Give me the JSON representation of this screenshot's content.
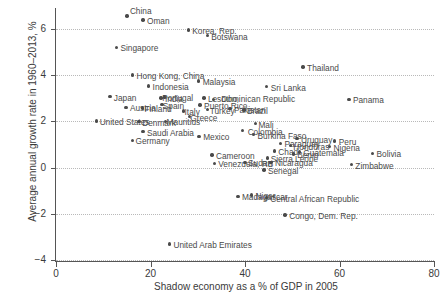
{
  "chart_data": {
    "type": "scatter",
    "title": "",
    "xlabel": "Shadow economy as a % of GDP in 2005",
    "ylabel": "Average annual growth rate in 1960–2013, %",
    "xlim": [
      0,
      80
    ],
    "ylim": [
      -4,
      6.9
    ],
    "xticks": [
      0,
      20,
      40,
      60,
      80
    ],
    "yticks": [
      -4,
      -2,
      0,
      2,
      4,
      6
    ],
    "xtick_labels": [
      "0",
      "20",
      "40",
      "60",
      "80"
    ],
    "ytick_labels": [
      "−4",
      "−2",
      "0",
      "2",
      "4",
      "6"
    ],
    "grid": "dotted-horizontal",
    "legend": "none",
    "marker": "filled-circle",
    "marker_color": "#4a4a4a",
    "points": [
      {
        "label": "China",
        "x": 15.0,
        "y": 6.55,
        "lx": 3,
        "ly": -9
      },
      {
        "label": "Oman",
        "x": 18.4,
        "y": 6.38,
        "lx": 4,
        "ly": -3
      },
      {
        "label": "Korea, Rep.",
        "x": 28.0,
        "y": 5.95,
        "lx": 4,
        "ly": -3
      },
      {
        "label": "Botswana",
        "x": 32.0,
        "y": 5.7,
        "lx": 4,
        "ly": -3
      },
      {
        "label": "Singapore",
        "x": 12.8,
        "y": 5.2,
        "lx": 4,
        "ly": -3
      },
      {
        "label": "Hong Kong, China",
        "x": 16.2,
        "y": 4.0,
        "lx": 4,
        "ly": -3
      },
      {
        "label": "Malaysia",
        "x": 30.2,
        "y": 3.75,
        "lx": 4,
        "ly": -3
      },
      {
        "label": "Thailand",
        "x": 52.3,
        "y": 4.35,
        "lx": 4,
        "ly": -3
      },
      {
        "label": "Indonesia",
        "x": 19.6,
        "y": 3.52,
        "lx": 4,
        "ly": -3
      },
      {
        "label": "Sri Lanka",
        "x": 44.6,
        "y": 3.5,
        "lx": 4,
        "ly": -3
      },
      {
        "label": "Japan",
        "x": 11.4,
        "y": 3.06,
        "lx": 4,
        "ly": -3
      },
      {
        "label": "India",
        "x": 22.2,
        "y": 3.0,
        "lx": 4,
        "ly": -3
      },
      {
        "label": "Portugal",
        "x": 22.9,
        "y": 3.05,
        "lx": -2,
        "ly": -3
      },
      {
        "label": "Lesotho",
        "x": 31.3,
        "y": 3.0,
        "lx": 4,
        "ly": -3
      },
      {
        "label": "Dominican Republic",
        "x": 33.3,
        "y": 2.95,
        "lx": 8,
        "ly": -4
      },
      {
        "label": "Panama",
        "x": 62.0,
        "y": 2.95,
        "lx": 4,
        "ly": -3
      },
      {
        "label": "Spain",
        "x": 22.4,
        "y": 2.72,
        "lx": 1,
        "ly": -3
      },
      {
        "label": "Puerto Rico",
        "x": 30.5,
        "y": 2.7,
        "lx": 4,
        "ly": -3
      },
      {
        "label": "Austria",
        "x": 14.8,
        "y": 2.6,
        "lx": 4,
        "ly": -3
      },
      {
        "label": "Finland",
        "x": 18.3,
        "y": 2.58,
        "lx": 2,
        "ly": -3
      },
      {
        "label": "Pakistan",
        "x": 36.8,
        "y": 2.55,
        "lx": 4,
        "ly": -3
      },
      {
        "label": "Turkey",
        "x": 32.1,
        "y": 2.5,
        "lx": 2,
        "ly": -3
      },
      {
        "label": "Brazil",
        "x": 39.8,
        "y": 2.48,
        "lx": 3,
        "ly": -3
      },
      {
        "label": "Italy",
        "x": 27.0,
        "y": 2.45,
        "lx": 1,
        "ly": -3
      },
      {
        "label": "Greece",
        "x": 28.2,
        "y": 2.2,
        "lx": 1,
        "ly": -3
      },
      {
        "label": "United States",
        "x": 8.6,
        "y": 2.02,
        "lx": 3,
        "ly": -3
      },
      {
        "label": "Denmark",
        "x": 17.6,
        "y": 1.98,
        "lx": 3,
        "ly": -3
      },
      {
        "label": "Mauritius",
        "x": 23.2,
        "y": 2.0,
        "lx": 1,
        "ly": -3
      },
      {
        "label": "Mali",
        "x": 42.2,
        "y": 1.9,
        "lx": 3,
        "ly": -3
      },
      {
        "label": "Saudi Arabia",
        "x": 18.4,
        "y": 1.55,
        "lx": 4,
        "ly": -3
      },
      {
        "label": "Germany",
        "x": 16.2,
        "y": 1.18,
        "lx": 3,
        "ly": -3
      },
      {
        "label": "Mexico",
        "x": 30.3,
        "y": 1.35,
        "lx": 4,
        "ly": -3
      },
      {
        "label": "Burkina Faso",
        "x": 41.8,
        "y": 1.42,
        "lx": 4,
        "ly": -3
      },
      {
        "label": "Colombia",
        "x": 39.5,
        "y": 1.6,
        "lx": 5,
        "ly": -3
      },
      {
        "label": "Peru",
        "x": 59.0,
        "y": 1.15,
        "lx": 4,
        "ly": -3
      },
      {
        "label": "Uruguay",
        "x": 51.0,
        "y": 1.25,
        "lx": 4,
        "ly": -3
      },
      {
        "label": "Paraguay",
        "x": 47.5,
        "y": 1.05,
        "lx": 4,
        "ly": -3
      },
      {
        "label": "Honduras",
        "x": 49.6,
        "y": 0.95,
        "lx": 3,
        "ly": -3
      },
      {
        "label": "Nigeria",
        "x": 57.9,
        "y": 0.9,
        "lx": 4,
        "ly": -3
      },
      {
        "label": "Guatemala",
        "x": 51.5,
        "y": 0.68,
        "lx": 4,
        "ly": -3
      },
      {
        "label": "Bolivia",
        "x": 67.0,
        "y": 0.62,
        "lx": 4,
        "ly": -3
      },
      {
        "label": "Benin",
        "x": 50.2,
        "y": 0.58,
        "lx": 4,
        "ly": -3
      },
      {
        "label": "Chad",
        "x": 46.2,
        "y": 0.72,
        "lx": 4,
        "ly": -3
      },
      {
        "label": "Cameroon",
        "x": 33.0,
        "y": 0.55,
        "lx": 4,
        "ly": -3
      },
      {
        "label": "Sierra Leone",
        "x": 44.8,
        "y": 0.42,
        "lx": 3,
        "ly": -3
      },
      {
        "label": "Venezuela, RB",
        "x": 33.5,
        "y": 0.18,
        "lx": 4,
        "ly": -3
      },
      {
        "label": "Sudan",
        "x": 40.0,
        "y": 0.22,
        "lx": 3,
        "ly": -3
      },
      {
        "label": "Nicaragua",
        "x": 45.5,
        "y": 0.22,
        "lx": 4,
        "ly": -3
      },
      {
        "label": "Zimbabwe",
        "x": 62.5,
        "y": 0.12,
        "lx": 4,
        "ly": -3
      },
      {
        "label": "Senegal",
        "x": 44.0,
        "y": -0.1,
        "lx": 4,
        "ly": -3
      },
      {
        "label": "Madagascar",
        "x": 38.5,
        "y": -1.25,
        "lx": 4,
        "ly": -3
      },
      {
        "label": "Niger",
        "x": 41.4,
        "y": -1.18,
        "lx": 4,
        "ly": -3
      },
      {
        "label": "Central African Republic",
        "x": 44.5,
        "y": -1.3,
        "lx": 4,
        "ly": -3
      },
      {
        "label": "Congo, Dem. Rep.",
        "x": 48.5,
        "y": -2.05,
        "lx": 4,
        "ly": -3
      },
      {
        "label": "United Arab Emirates",
        "x": 24.0,
        "y": -3.3,
        "lx": 4,
        "ly": -3
      }
    ]
  }
}
